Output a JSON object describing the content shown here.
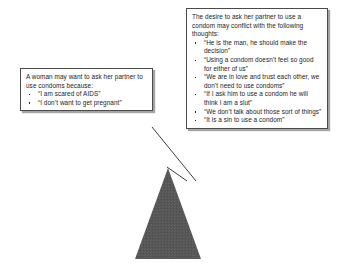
{
  "diagram": {
    "shape": {
      "name": "triangle",
      "fill_color": "#575757",
      "label": ""
    },
    "callouts": [
      {
        "id": "left",
        "lead": "A woman may want to ask her partner to use condoms because:",
        "bullets": [
          "“I am scared of AIDS”",
          "“I don’t want to get pregnant”"
        ]
      },
      {
        "id": "right",
        "lead": "The desire to ask her partner to use a condom may conflict with the following thoughts:",
        "bullets": [
          "“He is the man, he should make the decision”",
          "“Using a condom doesn’t feel so good for either of us”",
          "“We are in love and trust each other, we don’t need to use condoms”",
          "“If I ask him to use a condom he will think I am a slut”",
          "“We don’t talk about those sort of things”",
          "“It is a sin to use a condom”"
        ]
      }
    ],
    "colors": {
      "border": "#4a4a4a",
      "text": "#1b1b1b",
      "background": "#ffffff",
      "connector": "#3c3c3c"
    }
  }
}
